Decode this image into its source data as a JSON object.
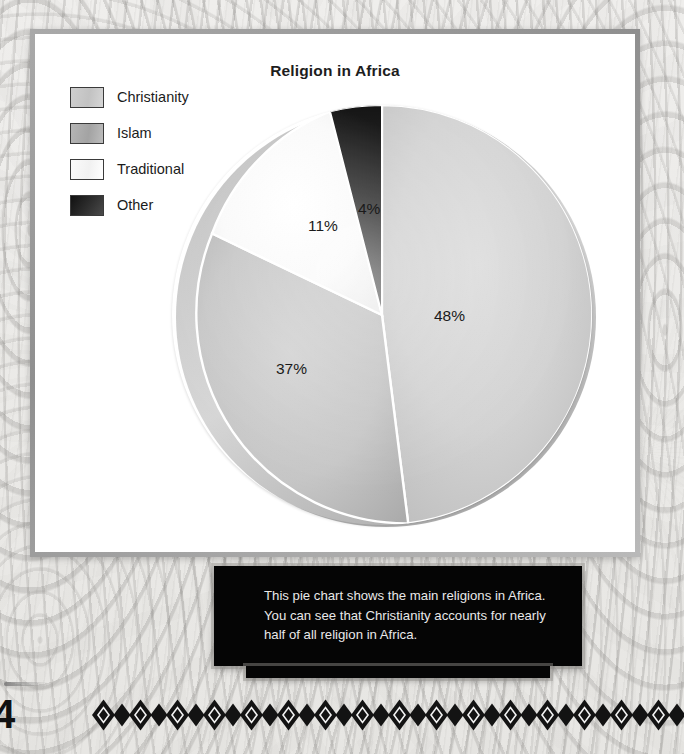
{
  "page": {
    "page_number": "4"
  },
  "chart_card": {
    "title": "Religion in Africa"
  },
  "legend": {
    "items": [
      {
        "label": "Christianity",
        "swatch": "light-gray",
        "color": "#c8c8c8"
      },
      {
        "label": "Islam",
        "swatch": "medium-gray",
        "color": "#acacac"
      },
      {
        "label": "Traditional",
        "swatch": "white",
        "color": "#f7f7f7"
      },
      {
        "label": "Other",
        "swatch": "black",
        "color": "#1c1c1c"
      }
    ]
  },
  "chart_data": {
    "type": "pie",
    "title": "Religion in Africa",
    "xlabel": "",
    "ylabel": "",
    "unit": "percent",
    "start_angle_deg": 0,
    "direction": "clockwise",
    "legend_position": "top-left",
    "grid": false,
    "categories": [
      "Christianity",
      "Islam",
      "Traditional",
      "Other"
    ],
    "values": [
      48,
      37,
      11,
      4
    ],
    "slices": [
      {
        "label": "Christianity",
        "value": 48,
        "data_label": "48%",
        "color": "#cfcfcf"
      },
      {
        "label": "Islam",
        "value": 37,
        "data_label": "37%",
        "color": "#c2c2c2"
      },
      {
        "label": "Traditional",
        "value": 11,
        "data_label": "11%",
        "color": "#fbfbfb"
      },
      {
        "label": "Other",
        "value": 4,
        "data_label": "4%",
        "color": "#161616"
      }
    ],
    "data_labels": [
      "48%",
      "37%",
      "11%",
      "4%"
    ]
  },
  "caption": {
    "text": "This pie chart shows the main religions in Africa. You can see that Christianity accounts for nearly half of all religion in Africa."
  }
}
